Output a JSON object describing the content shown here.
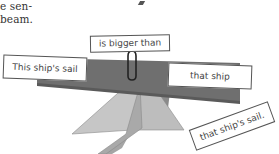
{
  "page_text": {
    "lines": [
      "e sen-",
      "beam."
    ]
  },
  "diagram": {
    "type": "balance-beam sentence diagram",
    "beam_color": "#6f6f6f",
    "pyramid_colors": {
      "left_face": "#c4c4c4",
      "front_face": "#a8a8a8",
      "right_face": "#b9b9b9",
      "back_face": "#8a8a8a"
    },
    "cards": {
      "top": "is bigger than",
      "left": "This ship's sail",
      "right": "that ship",
      "bottom_right": "that ship's sail."
    },
    "connector": "paper-clip"
  }
}
